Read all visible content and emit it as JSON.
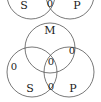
{
  "diagram": {
    "stroke_color": "#555555",
    "text_color": "#1a1a1a",
    "background": "#ffffff",
    "top_diagram": {
      "name": "two-circle-venn-conclusion",
      "circles": [
        {
          "label": "S",
          "cx": 31,
          "cy": -5,
          "r": 24
        },
        {
          "label": "P",
          "cx": 70,
          "cy": -5,
          "r": 24
        }
      ],
      "labels": [
        {
          "text": "S",
          "x": 24,
          "y": 5,
          "region": "S-only"
        },
        {
          "text": "0",
          "x": 50,
          "y": 4,
          "region": "S-and-P"
        },
        {
          "text": "P",
          "x": 77,
          "y": 5,
          "region": "P-only"
        }
      ]
    },
    "bottom_diagram": {
      "name": "three-circle-venn-premises",
      "circles": [
        {
          "label": "M",
          "cx": 50,
          "cy": 48,
          "r": 25
        },
        {
          "label": "S",
          "cx": 32,
          "cy": 72,
          "r": 25
        },
        {
          "label": "P",
          "cx": 69,
          "cy": 72,
          "r": 25
        }
      ],
      "labels": [
        {
          "text": "M",
          "x": 50,
          "y": 30,
          "region": "M-only"
        },
        {
          "text": "0",
          "x": 72,
          "y": 51,
          "region": "M-and-P"
        },
        {
          "text": "0",
          "x": 14,
          "y": 67,
          "region": "S-only"
        },
        {
          "text": "0",
          "x": 51,
          "y": 62,
          "region": "M-and-S-and-P"
        },
        {
          "text": "S",
          "x": 30,
          "y": 88,
          "region": "S-label"
        },
        {
          "text": "0",
          "x": 51,
          "y": 87,
          "region": "S-and-P"
        },
        {
          "text": "P",
          "x": 73,
          "y": 88,
          "region": "P-label"
        }
      ]
    }
  }
}
